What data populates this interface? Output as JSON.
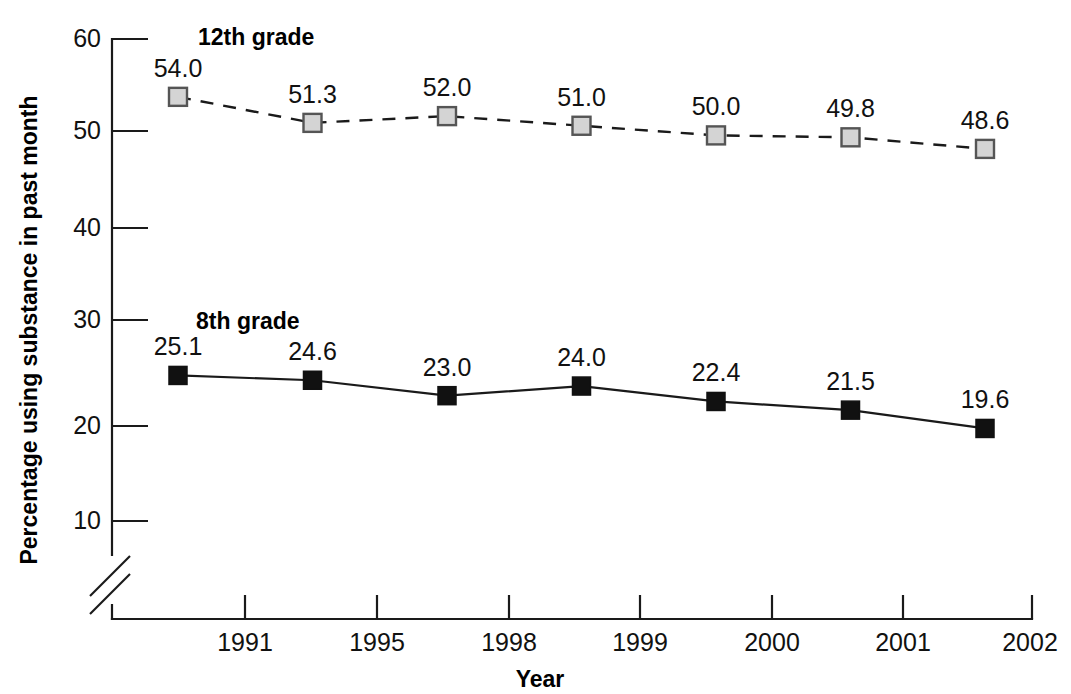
{
  "chart_data": {
    "type": "line",
    "title": "",
    "xlabel": "Year",
    "ylabel": "Percentage using substance in past month",
    "x": [
      "1991",
      "1995",
      "1998",
      "1999",
      "2000",
      "2001",
      "2002"
    ],
    "categories": [
      "1991",
      "1995",
      "1998",
      "1999",
      "2000",
      "2001",
      "2002"
    ],
    "xtick_labels": [
      "1991",
      "1995",
      "1998",
      "1999",
      "2000",
      "2001",
      "2002"
    ],
    "ytick_labels": [
      "60",
      "50",
      "40",
      "30",
      "20",
      "10"
    ],
    "yticks": [
      60,
      50,
      40,
      30,
      20,
      10
    ],
    "ylim": [
      8,
      60
    ],
    "grid": false,
    "legend_position": "inline-annotation",
    "axis_break": true,
    "axis_break_note": "y-axis broken between 0 and 10",
    "series": [
      {
        "name": "12th grade",
        "marker": "open-square-gray",
        "line_style": "dashed",
        "label_x": 198,
        "label_y": 45,
        "values": [
          54.0,
          51.3,
          52.0,
          51.0,
          50.0,
          49.8,
          48.6
        ],
        "value_labels": [
          "54.0",
          "51.3",
          "52.0",
          "51.0",
          "50.0",
          "49.8",
          "48.6"
        ]
      },
      {
        "name": "8th grade",
        "marker": "filled-square-black",
        "line_style": "solid",
        "label_x": 196,
        "label_y": 329,
        "values": [
          25.1,
          24.6,
          23.0,
          24.0,
          22.4,
          21.5,
          19.6
        ],
        "value_labels": [
          "25.1",
          "24.6",
          "23.0",
          "24.0",
          "22.4",
          "21.5",
          "19.6"
        ]
      }
    ],
    "colors": {
      "axis": "#1a1a1a",
      "text": "#111111",
      "series_12th_marker_fill": "#d4d4d4",
      "series_12th_marker_stroke": "#555555",
      "series_8th_marker_fill": "#111111",
      "background": "#ffffff"
    }
  }
}
